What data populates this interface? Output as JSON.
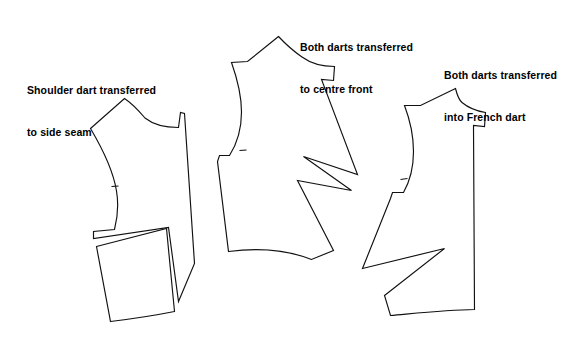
{
  "figure": {
    "background_color": "#ffffff",
    "line_color": "#111111",
    "text_color": "#000000"
  },
  "captions": [
    {
      "id": "caption-1",
      "name": "caption-shoulder-dart",
      "line1": "Shoulder dart transferred",
      "line2": "to side seam"
    },
    {
      "id": "caption-2",
      "name": "caption-centre-front",
      "line1": "Both darts transferred",
      "line2": "to centre front"
    },
    {
      "id": "caption-3",
      "name": "caption-french-dart",
      "line1": "Both darts transferred",
      "line2": "into French dart"
    }
  ],
  "pieces": [
    {
      "name": "bodice-front-side-seam-dart",
      "label": "Shoulder dart transferred to side seam",
      "outline_path": "M 90.5,128.5 L 124.5,98.5 C 133,104 139,111 145,118 C 152.5,124 162,127.5 178.5,127.5 L 180.5,112.5 L 184.5,113.5 L 194.5,263.5 L 178.5,301.5 L 168.5,227.5 L 93.5,238.5 L 93.5,231.5 L 114.5,229.5 C 118,216 118.5,203 116.5,191 C 113.5,172 105,153 90.5,128.5 Z",
      "notches": [
        {
          "name": "armhole-notch",
          "x1": 111.5,
          "y1": 186.5,
          "x2": 118.5,
          "y2": 186.0
        }
      ],
      "sub_pieces": [
        {
          "name": "side-dart-wedge-panel",
          "path": "M 96.5,246.5 L 166.5,228.5 L 174.5,311.5 C 152,316 131,319 110.5,321.5 Z"
        }
      ]
    },
    {
      "name": "bodice-front-centre-front-dart",
      "label": "Both darts transferred to centre front",
      "outline_path": "M 278.5,36.5 L 247.5,61.5 L 231.5,62.5 C 237,78 241.5,95 241.5,112 C 241.5,128 237.5,143 229.5,155.5 L 219.5,155.5 L 217.5,161.5 L 228.5,251.5 C 258,247.5 285,249 311.5,259.5 L 333.5,250.5 L 297.5,180.5 L 351.5,190.5 L 303.5,156.5 L 357.5,174.5 L 321.5,79.5 L 333.5,80.5 L 334.5,66.5 C 322,66.5 311,63.5 302,57 C 294,51.5 286,44.5 278.5,36.5 Z",
      "notches": [
        {
          "name": "armhole-notch",
          "x1": 239.5,
          "y1": 150.5,
          "x2": 246.5,
          "y2": 150.0
        }
      ],
      "sub_pieces": []
    },
    {
      "name": "bodice-front-french-dart",
      "label": "Both darts transferred into French dart",
      "outline_path": "M 455.5,88.5 L 420.5,105.5 L 404.5,105.5 C 410,120 413.5,136 413.5,151.5 C 413.5,167 410,181 403.5,192.5 L 392.5,192.5 L 390.5,198.5 L 362.5,268.5 L 444.5,248.5 L 384.5,295.5 L 390.5,315.5 C 419,313 447,310 474.5,309.5 L 473.5,125.5 L 484.5,126.5 L 485.5,112.5 C 476,111 468,107.5 462,102.5 C 459,100 457,94.5 455.5,88.5 Z",
      "notches": [
        {
          "name": "armhole-notch",
          "x1": 400.5,
          "y1": 179.5,
          "x2": 407.5,
          "y2": 178.5
        }
      ],
      "sub_pieces": []
    }
  ]
}
